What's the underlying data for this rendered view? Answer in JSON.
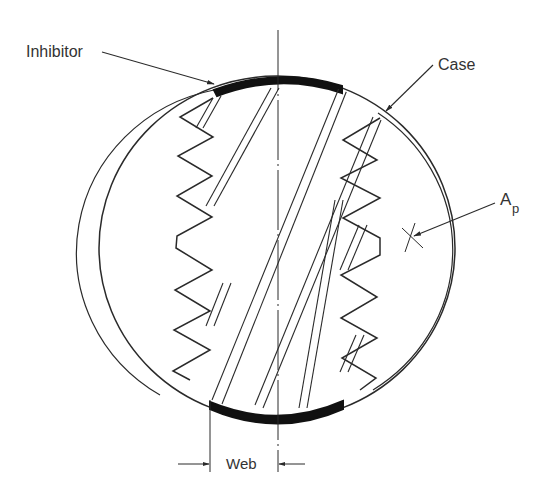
{
  "diagram": {
    "type": "cross-section",
    "labels": {
      "inhibitor": "Inhibitor",
      "case": "Case",
      "port_area_main": "A",
      "port_area_sub": "p",
      "web": "Web"
    },
    "colors": {
      "line": "#2a2a2a",
      "inhibitor": "#111111",
      "background": "#ffffff"
    },
    "geometry": {
      "case_center": [
        277,
        248
      ],
      "case_rx": 178,
      "case_ry": 172,
      "axis_x": 278
    }
  }
}
